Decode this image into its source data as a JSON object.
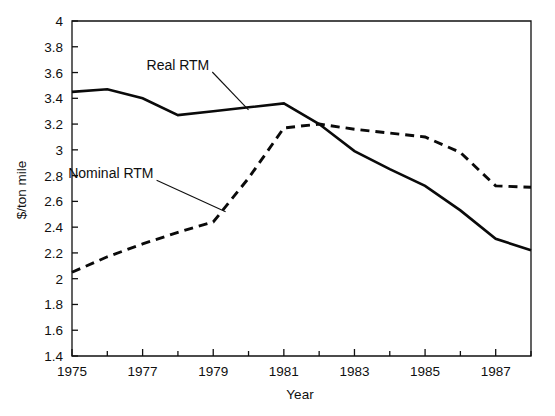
{
  "chart_data": {
    "type": "line",
    "title": "",
    "xlabel": "Year",
    "ylabel": "$/ton mile",
    "xlim": [
      1975,
      1988
    ],
    "ylim": [
      1.4,
      4
    ],
    "grid": false,
    "legend_position": "inline-annotations",
    "x": [
      1975,
      1976,
      1977,
      1978,
      1979,
      1980,
      1981,
      1982,
      1983,
      1984,
      1985,
      1986,
      1987,
      1988
    ],
    "xtick_labels": [
      "1975",
      "1977",
      "1979",
      "1981",
      "1983",
      "1985",
      "1987"
    ],
    "xtick_values": [
      1975,
      1977,
      1979,
      1981,
      1983,
      1985,
      1987
    ],
    "xminor_tick_values": [
      1976,
      1978,
      1980,
      1982,
      1984,
      1986,
      1988
    ],
    "ytick_labels": [
      "1.4",
      "1.6",
      "1.8",
      "2",
      "2.2",
      "2.4",
      "2.6",
      "2.8",
      "3",
      "3.2",
      "3.4",
      "3.6",
      "3.8",
      "4"
    ],
    "ytick_values": [
      1.4,
      1.6,
      1.8,
      2.0,
      2.2,
      2.4,
      2.6,
      2.8,
      3.0,
      3.2,
      3.4,
      3.6,
      3.8,
      4.0
    ],
    "series": [
      {
        "name": "Real RTM",
        "style": "solid",
        "color": "#0a0a0a",
        "values": [
          3.45,
          3.47,
          3.4,
          3.27,
          3.3,
          3.33,
          3.36,
          3.2,
          2.99,
          2.85,
          2.72,
          2.53,
          2.31,
          2.22
        ]
      },
      {
        "name": "Nominal RTM",
        "style": "dashed",
        "color": "#0a0a0a",
        "values": [
          2.05,
          2.17,
          2.27,
          2.36,
          2.44,
          2.78,
          3.17,
          3.2,
          3.16,
          3.13,
          3.1,
          2.98,
          2.72,
          2.71
        ]
      }
    ],
    "annotations": [
      {
        "text": "Real RTM",
        "label_x": 1978.0,
        "label_y": 3.62,
        "target_x": 1980.0,
        "target_y": 3.31
      },
      {
        "text": "Nominal RTM",
        "label_x": 1976.1,
        "label_y": 2.78,
        "target_x": 1979.35,
        "target_y": 2.52
      }
    ]
  }
}
